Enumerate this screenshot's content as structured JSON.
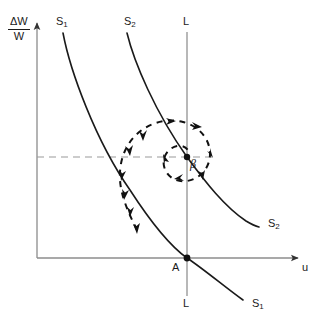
{
  "figure": {
    "type": "phase-plane-diagram",
    "background": "#ffffff",
    "width": 317,
    "height": 326
  },
  "axes": {
    "y_label_numerator": "ΔW",
    "y_label_denominator": "W",
    "x_label": "u",
    "origin": {
      "x": 37,
      "y": 258
    },
    "x_axis_end": {
      "x": 302,
      "y": 258
    },
    "y_axis_top": {
      "x": 37,
      "y": 18
    },
    "color": "#8c8c8c",
    "arrow_color": "#333333"
  },
  "curves": {
    "S1": {
      "label": "S₁",
      "label_top": "S1",
      "label_bottom": "S1",
      "color": "#1a1a1a",
      "description": "upper-left to lower-right decreasing convex curve passing through point A"
    },
    "S2": {
      "label": "S₂",
      "label_top": "S2",
      "label_bottom": "S2",
      "color": "#1a1a1a",
      "description": "upper-left to lower-right decreasing convex curve passing through point beta"
    },
    "L": {
      "label_top": "L",
      "label_bottom": "L",
      "color": "#8c8c8c",
      "description": "vertical line through A and beta"
    }
  },
  "points": {
    "A": {
      "label": "A",
      "x": 187,
      "y": 258,
      "marker": "filled-dot"
    },
    "beta": {
      "label": "β",
      "x": 187,
      "y": 157,
      "marker": "filled-dot"
    }
  },
  "guides": {
    "horizontal_dashed": {
      "from_x": 37,
      "to_x": 215,
      "y": 157,
      "color": "#8c8c8c",
      "style": "dashed"
    }
  },
  "trajectory": {
    "name": "spiral-trajectory",
    "style": "dashed",
    "color": "#111111",
    "direction": "counterclockwise-inward",
    "converges_to": "β",
    "arrowheads": 9
  },
  "labels": {
    "S1_top": {
      "text": "S1",
      "x": 56,
      "y": 22
    },
    "S2_top": {
      "text": "S2",
      "x": 124,
      "y": 22
    },
    "L_top": {
      "text": "L",
      "x": 183,
      "y": 22
    },
    "S2_right": {
      "text": "S2",
      "x": 268,
      "y": 224
    },
    "S1_right": {
      "text": "S1",
      "x": 252,
      "y": 300
    },
    "L_bottom": {
      "text": "L",
      "x": 183,
      "y": 303
    },
    "A": {
      "text": "A",
      "x": 174,
      "y": 266
    },
    "beta": {
      "text": "β",
      "x": 191,
      "y": 162
    },
    "u": {
      "text": "u",
      "x": 303,
      "y": 265
    }
  }
}
